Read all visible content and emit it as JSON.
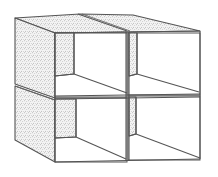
{
  "figure": {
    "style": "line drawing with stippled shading",
    "grid": {
      "rows": 2,
      "columns": 2
    },
    "colors": {
      "line": "#555555",
      "stipple": "#8a8a8a",
      "background": "#ffffff"
    }
  },
  "boxes": [
    {
      "id": "top-left",
      "row": 1,
      "column": 1
    },
    {
      "id": "top-right",
      "row": 1,
      "column": 2
    },
    {
      "id": "bottom-left",
      "row": 2,
      "column": 1
    },
    {
      "id": "bottom-right",
      "row": 2,
      "column": 2
    }
  ]
}
